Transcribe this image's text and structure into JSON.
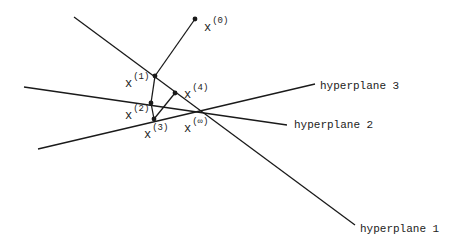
{
  "diagram": {
    "type": "projection-onto-hyperplanes",
    "colors": {
      "line": "#1a1a1a",
      "text": "#222222",
      "background": "#ffffff"
    },
    "hyperplanes": [
      {
        "id": "hp1",
        "label": "hyperplane 1",
        "x1": 74,
        "y1": 17,
        "x2": 355,
        "y2": 225,
        "label_x": 360,
        "label_y": 232
      },
      {
        "id": "hp2",
        "label": "hyperplane 2",
        "x1": 24,
        "y1": 87,
        "x2": 287,
        "y2": 125,
        "label_x": 294,
        "label_y": 128
      },
      {
        "id": "hp3",
        "label": "hyperplane 3",
        "x1": 38,
        "y1": 149,
        "x2": 315,
        "y2": 84,
        "label_x": 320,
        "label_y": 89
      }
    ],
    "points": [
      {
        "id": "x0",
        "base": "x",
        "sup": "(0)",
        "x": 195,
        "y": 19,
        "label_x": 204,
        "label_y": 31
      },
      {
        "id": "x1",
        "base": "x",
        "sup": "(1)",
        "x": 155,
        "y": 76,
        "label_x": 125,
        "label_y": 87
      },
      {
        "id": "x2",
        "base": "x",
        "sup": "(2)",
        "x": 151,
        "y": 103,
        "label_x": 125,
        "label_y": 119
      },
      {
        "id": "x3",
        "base": "x",
        "sup": "(3)",
        "x": 154,
        "y": 119,
        "label_x": 144,
        "label_y": 138
      },
      {
        "id": "x4",
        "base": "x",
        "sup": "(4)",
        "x": 175,
        "y": 93,
        "label_x": 184,
        "label_y": 98
      },
      {
        "id": "xinf",
        "base": "x",
        "sup": "(∞)",
        "x": 200,
        "y": 109,
        "label_x": 184,
        "label_y": 132
      }
    ],
    "path": [
      "x0",
      "x1",
      "x2",
      "x3",
      "x4"
    ]
  }
}
